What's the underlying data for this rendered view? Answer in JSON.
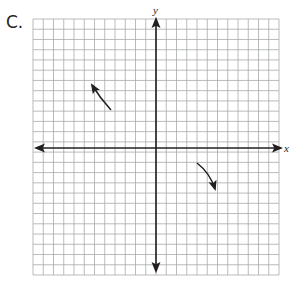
{
  "problem": {
    "label": "C."
  },
  "graph": {
    "x_axis_label": "x",
    "y_axis_label": "y",
    "grid": {
      "left": 33,
      "top": 19,
      "right": 279,
      "bottom": 275,
      "columns": 24,
      "rows": 25,
      "line_color": "#a7a9ac",
      "axis_color": "#231f20"
    },
    "axes": {
      "x_axis_y": 148,
      "y_axis_x": 156
    },
    "end_behavior_arrows": [
      {
        "name": "upper-left-arrow",
        "direction": "up-left",
        "quadrant": "II"
      },
      {
        "name": "lower-right-arrow",
        "direction": "down-right",
        "quadrant": "IV"
      }
    ]
  }
}
